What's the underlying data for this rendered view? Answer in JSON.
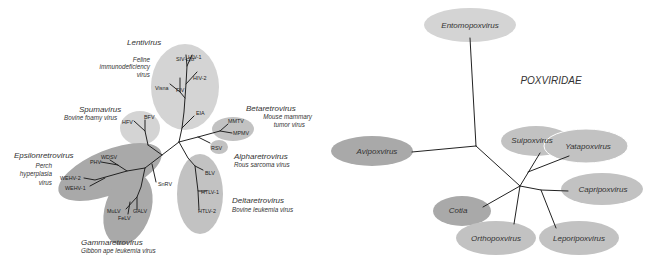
{
  "retroviridae_tree": {
    "groups": [
      {
        "genus": "Lentivirus",
        "example": [
          "Feline",
          "immunodeficiency",
          "virus"
        ],
        "tips": [
          "SIV-cpz",
          "HIV-1",
          "HIV-2",
          "FIV",
          "Visna",
          "EIA"
        ]
      },
      {
        "genus": "Spumavirus",
        "example": [
          "Bovine foamy virus"
        ],
        "tips": [
          "BFV",
          "HFV"
        ]
      },
      {
        "genus": "Betaretrovirus",
        "example": [
          "Mouse mammary",
          "tumor virus"
        ],
        "tips": [
          "MMTV",
          "MPMV"
        ]
      },
      {
        "genus": "Alpharetrovirus",
        "example": [
          "Rous sarcoma virus"
        ],
        "tips": [
          "RSV"
        ]
      },
      {
        "genus": "Epsilonretrovirus",
        "example": [
          "Perch",
          "hyperplasia",
          "virus"
        ],
        "tips": [
          "WDSV",
          "PHV",
          "WEHV-2",
          "WEHV-1"
        ]
      },
      {
        "genus": "Gammaretrovirus",
        "example": [
          "Gibbon ape leukemia virus"
        ],
        "tips": [
          "MuLV",
          "FeLV",
          "GALV"
        ]
      },
      {
        "genus": "Deltaretrovirus",
        "example": [
          "Bovine leukemia virus"
        ],
        "tips": [
          "BLV",
          "HTLV-1",
          "HTLV-2"
        ]
      }
    ],
    "unassigned_tip": "SnRV"
  },
  "poxviridae_tree": {
    "title": "POXVIRIDAE",
    "genera": [
      "Entomopoxvirus",
      "Avipoxvirus",
      "Suipoxvirus",
      "Yatapoxvirus",
      "Capripoxvirus",
      "Cotia",
      "Orthopoxvirus",
      "Leporipoxvirus"
    ]
  },
  "colors": {
    "light_ellipse": "#d4d4d4",
    "mid_ellipse": "#c2c2c2",
    "dark_ellipse": "#a9a9a9",
    "branch": "#222222",
    "label": "#333333"
  }
}
